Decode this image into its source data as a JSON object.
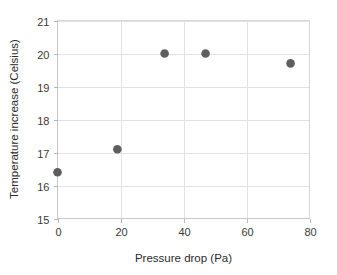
{
  "chart_data": {
    "type": "scatter",
    "title": "",
    "xlabel": "Pressure drop (Pa)",
    "ylabel": "Temperature increase (Celsius)",
    "xlim": [
      0,
      80
    ],
    "ylim": [
      15,
      21
    ],
    "xticks": [
      "0",
      "20",
      "40",
      "60",
      "80"
    ],
    "xtick_values": [
      0,
      20,
      40,
      60,
      80
    ],
    "yticks": [
      "15",
      "16",
      "17",
      "18",
      "19",
      "20",
      "21"
    ],
    "ytick_values": [
      15,
      16,
      17,
      18,
      19,
      20,
      21
    ],
    "grid": "horizontal-and-vertical",
    "legend": "none",
    "series": [
      {
        "name": "Temperature increase vs pressure drop",
        "marker": "filled-circle",
        "color": "#5e5e5e",
        "x": [
          0,
          19,
          34,
          47,
          74
        ],
        "y": [
          16.4,
          17.1,
          20.0,
          20.0,
          19.7
        ],
        "points": [
          {
            "x": 0,
            "y": 16.4
          },
          {
            "x": 19,
            "y": 17.1
          },
          {
            "x": 34,
            "y": 20.0
          },
          {
            "x": 47,
            "y": 20.0
          },
          {
            "x": 74,
            "y": 19.7
          }
        ]
      }
    ]
  },
  "colors": {
    "marker": "#5e5e5e",
    "gridline": "#e2e2e2",
    "axis": "#c8c8c8",
    "text": "#3a3a3a",
    "background": "#ffffff"
  },
  "axes": {
    "x_title": "Pressure drop (Pa)",
    "y_title": "Temperature increase (Celsius)",
    "x_tick_labels": [
      "0",
      "20",
      "40",
      "60",
      "80"
    ],
    "y_tick_labels": [
      "15",
      "16",
      "17",
      "18",
      "19",
      "20",
      "21"
    ]
  }
}
